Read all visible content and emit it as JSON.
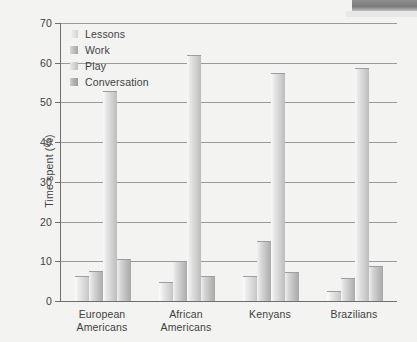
{
  "chart_data": {
    "type": "bar",
    "title": "",
    "subtitle": "",
    "xlabel": "",
    "ylabel": "Time spent (%)",
    "ylim": [
      0,
      70
    ],
    "ytick_step": 10,
    "yticks": [
      70,
      60,
      50,
      40,
      30,
      20,
      10,
      0
    ],
    "grid": true,
    "grid_axis": "y",
    "legend_position": "top-left inside plot",
    "categories": [
      "European Americans",
      "African Americans",
      "Kenyans",
      "Brazilians"
    ],
    "category_lines": [
      [
        "European",
        "Americans"
      ],
      [
        "African",
        "Americans"
      ],
      [
        "Kenyans"
      ],
      [
        "Brazilians"
      ]
    ],
    "series": [
      {
        "name": "Lessons",
        "values": [
          6.2,
          4.7,
          6.4,
          2.5
        ]
      },
      {
        "name": "Work",
        "values": [
          7.6,
          10.1,
          15.0,
          5.7
        ]
      },
      {
        "name": "Play",
        "values": [
          53.0,
          62.0,
          57.4,
          58.7
        ]
      },
      {
        "name": "Conversation",
        "values": [
          10.6,
          6.2,
          7.3,
          8.7
        ]
      }
    ],
    "colors": {
      "lessons": "#e3e3e3",
      "work": "#bdbdbd",
      "play": "#d4d4d4",
      "conversation": "#b2b2b2",
      "axis": "#6e6e6e",
      "grid": "#9a9a9a",
      "background": "#f3f3f1",
      "text": "#3f3f3f"
    }
  },
  "legend": {
    "items": [
      {
        "label": "Lessons"
      },
      {
        "label": "Work"
      },
      {
        "label": "Play"
      },
      {
        "label": "Conversation"
      }
    ]
  }
}
